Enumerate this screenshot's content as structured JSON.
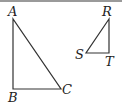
{
  "figure": {
    "triangle_abc": {
      "labels": {
        "a": "A",
        "b": "B",
        "c": "C"
      }
    },
    "triangle_rst": {
      "labels": {
        "r": "R",
        "s": "S",
        "t": "T"
      }
    },
    "colors": {
      "stroke": "#333333",
      "border": "#9a9a9a"
    }
  }
}
